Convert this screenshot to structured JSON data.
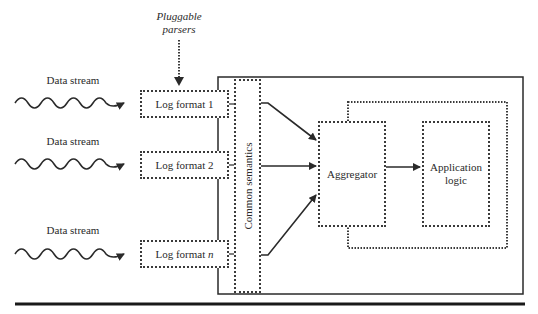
{
  "diagram": {
    "annotation": {
      "line1": "Pluggable",
      "line2": "parsers"
    },
    "streams": [
      {
        "label": "Data stream"
      },
      {
        "label": "Data stream"
      },
      {
        "label": "Data stream"
      }
    ],
    "parsers": [
      {
        "label": "Log format 1",
        "main": "Log format ",
        "suffix": "1"
      },
      {
        "label": "Log format 2",
        "main": "Log format ",
        "suffix": "2"
      },
      {
        "label": "Log format n",
        "main": "Log format ",
        "suffix": "n"
      }
    ],
    "common_semantics": "Common semantics",
    "aggregator": "Aggregator",
    "application_logic": {
      "line1": "Application",
      "line2": "logic"
    },
    "colors": {
      "line": "#2a2a2a",
      "background": "#ffffff"
    }
  }
}
